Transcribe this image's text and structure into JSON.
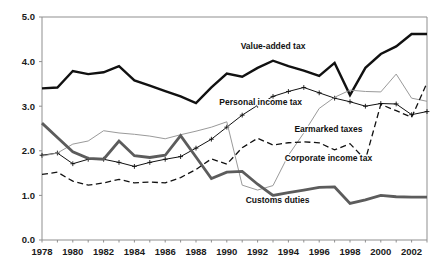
{
  "chart_data": {
    "type": "line",
    "title": "",
    "subtitle": "",
    "xlabel": "",
    "ylabel": "",
    "xlim": [
      1978,
      2003
    ],
    "ylim": [
      0.0,
      5.0
    ],
    "grid": false,
    "legend_position": "inline-annotations",
    "x": [
      1978,
      1979,
      1980,
      1981,
      1982,
      1983,
      1984,
      1985,
      1986,
      1987,
      1988,
      1989,
      1990,
      1991,
      1992,
      1993,
      1994,
      1995,
      1996,
      1997,
      1998,
      1999,
      2000,
      2001,
      2002,
      2003
    ],
    "xticks": [
      1978,
      1980,
      1982,
      1984,
      1986,
      1988,
      1990,
      1992,
      1994,
      1996,
      1998,
      2000,
      2002
    ],
    "xticklabels": [
      "1978",
      "1980",
      "1982",
      "1984",
      "1986",
      "1988",
      "1990",
      "1992",
      "1994",
      "1996",
      "1998",
      "2000",
      "2002"
    ],
    "yticks": [
      0.0,
      1.0,
      2.0,
      3.0,
      4.0,
      5.0
    ],
    "yticklabels": [
      "0.0",
      "1.0",
      "2.0",
      "3.0",
      "4.0",
      "5.0"
    ],
    "series": [
      {
        "name": "Value-added tax",
        "style": "solid-thick-black",
        "color": "#111111",
        "marker": "none",
        "label_x": 1993.0,
        "label_y": 4.28,
        "values": [
          3.4,
          3.42,
          3.79,
          3.72,
          3.76,
          3.9,
          3.58,
          3.46,
          3.34,
          3.22,
          3.07,
          3.42,
          3.73,
          3.66,
          3.86,
          4.02,
          3.9,
          3.8,
          3.68,
          3.97,
          3.25,
          3.86,
          4.17,
          4.34,
          4.62,
          4.62
        ]
      },
      {
        "name": "Personal income tax",
        "style": "solid-thin-black-plus",
        "color": "#111111",
        "marker": "plus",
        "label_x": 1992.2,
        "label_y": 3.02,
        "values": [
          1.9,
          1.95,
          1.71,
          1.81,
          1.81,
          1.74,
          1.65,
          1.74,
          1.81,
          1.87,
          2.06,
          2.26,
          2.53,
          2.8,
          3.02,
          3.22,
          3.33,
          3.42,
          3.3,
          3.18,
          3.1,
          3.0,
          3.06,
          3.05,
          2.81,
          2.88
        ]
      },
      {
        "name": "Earmarked taxes",
        "style": "solid-thin-gray",
        "color": "#9a9a9a",
        "marker": "none",
        "label_x": 1996.6,
        "label_y": 2.42,
        "values": [
          1.88,
          1.95,
          2.15,
          2.22,
          2.45,
          2.4,
          2.37,
          2.33,
          2.27,
          2.36,
          2.44,
          2.53,
          2.65,
          1.23,
          1.12,
          1.22,
          1.9,
          2.4,
          2.95,
          3.2,
          3.36,
          3.33,
          3.32,
          3.72,
          3.18,
          3.11
        ]
      },
      {
        "name": "Corporate income tax",
        "style": "dashed-black",
        "color": "#111111",
        "marker": "none",
        "label_x": 1996.6,
        "label_y": 1.78,
        "values": [
          1.47,
          1.52,
          1.32,
          1.23,
          1.28,
          1.36,
          1.28,
          1.3,
          1.28,
          1.4,
          1.58,
          1.82,
          1.7,
          2.07,
          2.28,
          2.13,
          2.18,
          2.2,
          2.18,
          2.02,
          2.16,
          1.8,
          3.04,
          2.9,
          2.75,
          3.52
        ]
      },
      {
        "name": "Customs duties",
        "style": "solid-thick-gray",
        "color": "#5c5c5c",
        "marker": "none",
        "label_x": 1993.3,
        "label_y": 0.82,
        "values": [
          2.62,
          2.3,
          1.98,
          1.83,
          1.81,
          2.22,
          1.89,
          1.85,
          1.9,
          2.34,
          1.86,
          1.38,
          1.52,
          1.54,
          1.25,
          1.0,
          1.06,
          1.12,
          1.18,
          1.19,
          0.82,
          0.9,
          1.0,
          0.97,
          0.96,
          0.96
        ]
      }
    ]
  },
  "axis": {
    "axis_color": "#8f8f8f",
    "background": "#ffffff"
  }
}
